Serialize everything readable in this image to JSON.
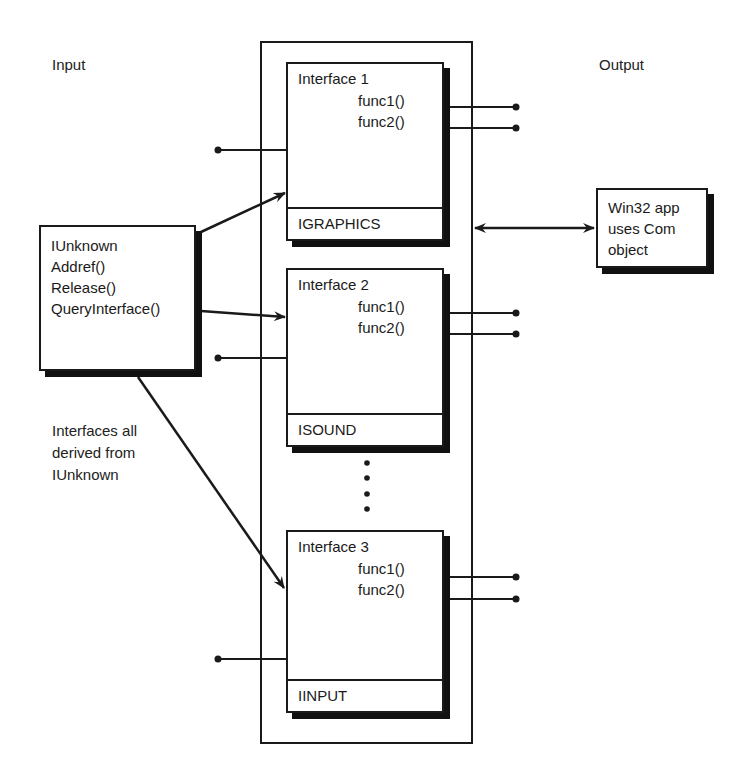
{
  "labels": {
    "input": "Input",
    "output": "Output",
    "derived_note": [
      "Interfaces all",
      "derived from",
      "IUnknown"
    ]
  },
  "iunknown_box": {
    "lines": [
      "IUnknown",
      "Addref()",
      "Release()",
      "QueryInterface()"
    ]
  },
  "client_box": {
    "lines": [
      "Win32 app",
      "uses Com",
      "object"
    ]
  },
  "interfaces": [
    {
      "title": "Interface 1",
      "funcs": [
        "func1()",
        "func2()"
      ],
      "name": "IGRAPHICS"
    },
    {
      "title": "Interface 2",
      "funcs": [
        "func1()",
        "func2()"
      ],
      "name": "ISOUND"
    },
    {
      "title": "Interface 3",
      "funcs": [
        "func1()",
        "func2()"
      ],
      "name": "IINPUT"
    }
  ],
  "colors": {
    "stroke": "#1a1a1a",
    "shadow": "#111111",
    "background": "#ffffff"
  }
}
